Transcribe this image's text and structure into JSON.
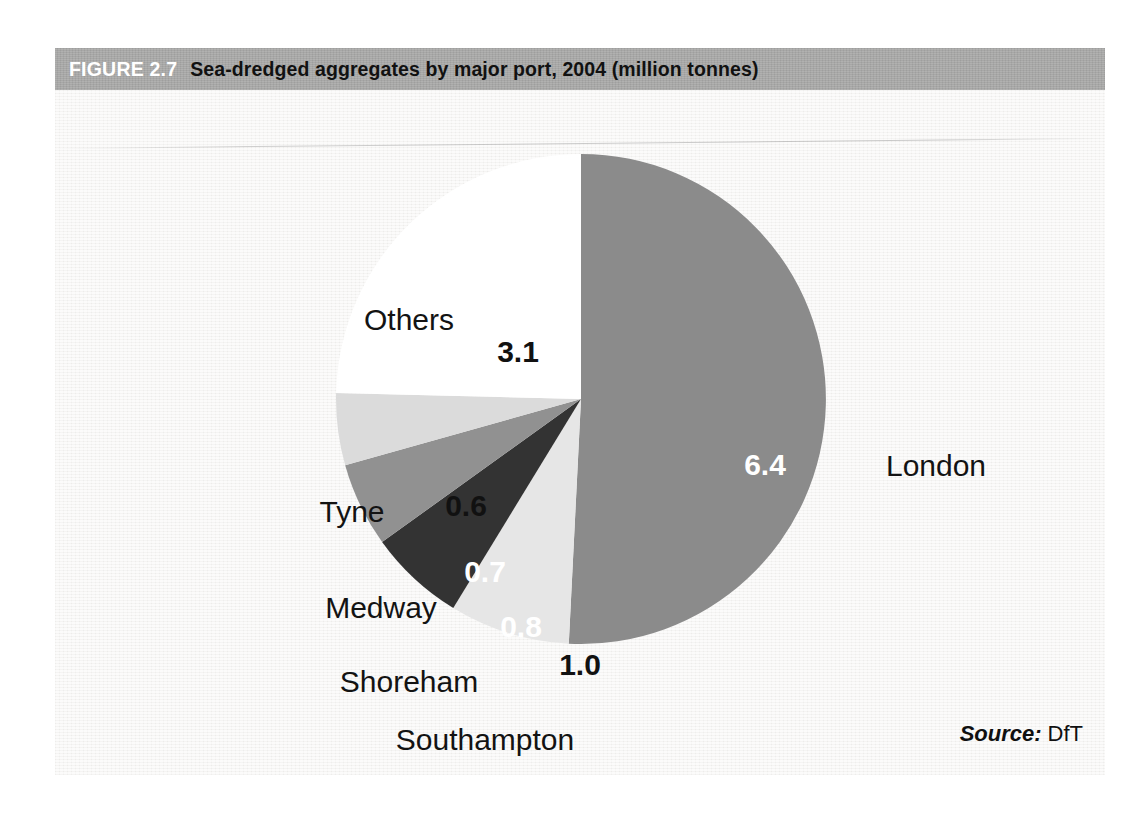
{
  "figure": {
    "number_label": "FIGURE 2.7",
    "title": "Sea-dredged aggregates by major port, 2004 (million tonnes)",
    "header_bg": "#a9a9a8",
    "body_bg": "#f3f2f0"
  },
  "source": {
    "label": "Source:",
    "value": "DfT"
  },
  "chart_data": {
    "type": "pie",
    "title": "Sea-dredged aggregates by major port, 2004 (million tonnes)",
    "unit": "million tonnes",
    "year": "2004",
    "total": 12.6,
    "start_angle_deg": 0,
    "direction": "clockwise",
    "legend": "none",
    "categories": [
      "London",
      "Southampton",
      "Shoreham",
      "Medway",
      "Tyne",
      "Others"
    ],
    "values": [
      6.4,
      1.0,
      0.8,
      0.7,
      0.6,
      3.1
    ],
    "value_labels": [
      "6.4",
      "1.0",
      "0.8",
      "0.7",
      "0.6",
      "3.1"
    ],
    "colors": [
      "#8b8b8b",
      "#e6e6e6",
      "#333333",
      "#919191",
      "#dbdbdb",
      "#ffffff"
    ],
    "label_text_colors": [
      "#ffffff",
      "#111111",
      "#ffffff",
      "#ffffff",
      "#111111",
      "#111111"
    ],
    "slices": [
      {
        "name": "London",
        "value": 6.4,
        "value_label": "6.4",
        "color": "#8b8b8b",
        "label_color": "#ffffff",
        "value_pos": {
          "x": 710,
          "y": 375
        },
        "category_pos": {
          "x": 881,
          "y": 376
        }
      },
      {
        "name": "Southampton",
        "value": 1.0,
        "value_label": "1.0",
        "color": "#e6e6e6",
        "label_color": "#111111",
        "value_pos": {
          "x": 525,
          "y": 575
        },
        "category_pos": {
          "x": 430,
          "y": 650
        }
      },
      {
        "name": "Shoreham",
        "value": 0.8,
        "value_label": "0.8",
        "color": "#333333",
        "label_color": "#ffffff",
        "value_pos": {
          "x": 466,
          "y": 537
        },
        "category_pos": {
          "x": 354,
          "y": 592
        }
      },
      {
        "name": "Medway",
        "value": 0.7,
        "value_label": "0.7",
        "color": "#919191",
        "label_color": "#ffffff",
        "value_pos": {
          "x": 430,
          "y": 482
        },
        "category_pos": {
          "x": 326,
          "y": 518
        }
      },
      {
        "name": "Tyne",
        "value": 0.6,
        "value_label": "0.6",
        "color": "#dbdbdb",
        "label_color": "#111111",
        "value_pos": {
          "x": 411,
          "y": 416
        },
        "category_pos": {
          "x": 297,
          "y": 422
        }
      },
      {
        "name": "Others",
        "value": 3.1,
        "value_label": "3.1",
        "color": "#ffffff",
        "label_color": "#111111",
        "value_pos": {
          "x": 463,
          "y": 262
        },
        "category_pos": {
          "x": 354,
          "y": 230
        }
      }
    ]
  }
}
